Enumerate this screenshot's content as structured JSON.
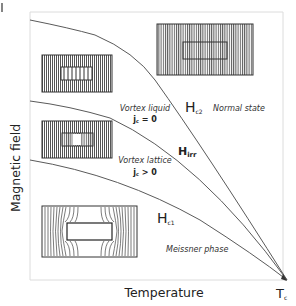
{
  "diagram": {
    "axes": {
      "y_label": "Magnetic field",
      "x_label": "Temperature",
      "x_end_label_main": "T",
      "x_end_label_sub": "c"
    },
    "curves": [
      {
        "id": "Hc2",
        "label_main": "H",
        "label_sub": "c2"
      },
      {
        "id": "Hirr",
        "label_main": "H",
        "label_sub": "irr"
      },
      {
        "id": "Hc1",
        "label_main": "H",
        "label_sub": "c1"
      }
    ],
    "regions": {
      "normal": {
        "label": "Normal state"
      },
      "vortex_liquid": {
        "label": "Vortex liquid",
        "condition_main": "j",
        "condition_sub": "c",
        "condition_rest": " = 0"
      },
      "vortex_lattice": {
        "label": "Vortex lattice",
        "condition_main": "j",
        "condition_sub": "c",
        "condition_rest": " > 0"
      },
      "meissner": {
        "label": "Meissner phase"
      }
    },
    "insets": [
      {
        "id": "normal-state-inset",
        "depicts": "uniform field lines penetrating sample"
      },
      {
        "id": "vortex-liquid-inset",
        "depicts": "field lines passing through sample with vortices"
      },
      {
        "id": "vortex-lattice-inset",
        "depicts": "field partially excluded, flux pinned"
      },
      {
        "id": "meissner-inset",
        "depicts": "field lines expelled around sample"
      }
    ],
    "colors": {
      "line": "#555555",
      "frame": "#d8d8d8",
      "hatch": "#6a6a6a",
      "text": "#222222"
    }
  }
}
